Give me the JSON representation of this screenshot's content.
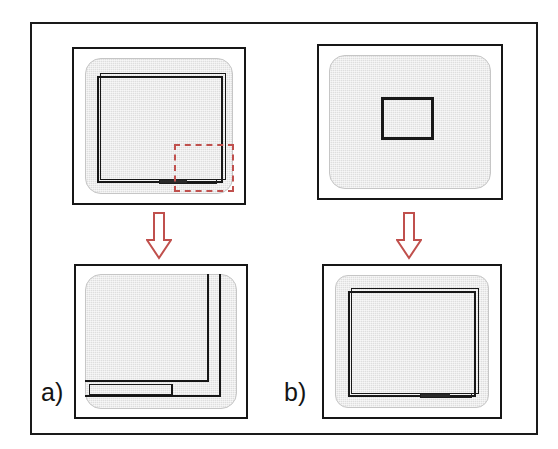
{
  "figure": {
    "domain": "diagram",
    "background_color": "#ffffff",
    "frame_border_color": "#1a1a1a",
    "screen_fill_color": "#dedede",
    "outline_color": "#171717",
    "accent_color": "#c0504d"
  },
  "columns": [
    {
      "id": "a",
      "label": "a)",
      "arrow": {
        "name": "down-arrow",
        "direction": "down",
        "color": "#c0504d",
        "style": "hollow-outline"
      },
      "before": {
        "name": "panel-a-before",
        "caption": "",
        "screen_fill": "#dedede",
        "viewport_outline": "#171717",
        "selection": {
          "name": "dashed-selection-region",
          "style": "dashed",
          "color": "#c0504d",
          "position": "bottom-right corner of viewport"
        },
        "notch": {
          "name": "bottom-bar-notch",
          "color": "#2a2a2a"
        }
      },
      "after": {
        "name": "panel-a-after",
        "caption": "",
        "note": "magnified bottom-right corner: viewport edge lines and bottom bar shown enlarged",
        "screen_fill": "#dedede",
        "viewport_outline": "#171717"
      }
    },
    {
      "id": "b",
      "label": "b)",
      "arrow": {
        "name": "down-arrow",
        "direction": "down",
        "color": "#c0504d",
        "style": "hollow-outline"
      },
      "before": {
        "name": "panel-b-before",
        "caption": "",
        "screen_fill": "#dedede",
        "small_rect": {
          "name": "small-centered-viewport",
          "outline": "#171717",
          "position": "center"
        }
      },
      "after": {
        "name": "panel-b-after",
        "caption": "",
        "note": "small rectangle expanded to near-full-screen viewport with bottom bar notch",
        "screen_fill": "#dedede",
        "viewport_outline": "#171717",
        "notch": {
          "name": "bottom-bar-notch",
          "color": "#2a2a2a"
        }
      }
    }
  ]
}
